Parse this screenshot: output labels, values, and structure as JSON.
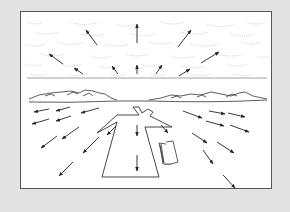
{
  "figure": {
    "title": "",
    "colors": {
      "background": "#e2e2e2",
      "panel": "#ffffff",
      "line": "#333333",
      "cloud": "#bdbdbd",
      "arrow": "#222222"
    },
    "sky": {
      "label": "",
      "arrow_direction": "upward-outward"
    },
    "ground": {
      "label": "",
      "arrow_direction": "downward-outward"
    },
    "runway": {
      "label": ""
    },
    "horizon": {
      "label": ""
    }
  }
}
